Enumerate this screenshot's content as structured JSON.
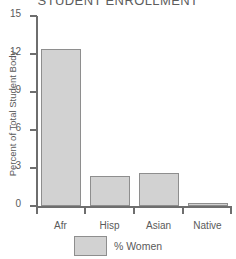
{
  "chart_data": {
    "type": "bar",
    "title": "STUDENT ENROLLMENT",
    "xlabel": "",
    "ylabel": "Percent of Total Student Body",
    "categories": [
      "Afr",
      "Hisp",
      "Asian",
      "Native"
    ],
    "series": [
      {
        "name": "% Women",
        "values": [
          12.4,
          2.4,
          2.6,
          0.2
        ]
      }
    ],
    "ylim": [
      0,
      15
    ],
    "yticks": [
      0,
      3,
      6,
      9,
      12,
      15
    ],
    "ytick_labels": [
      "0",
      "3",
      "6",
      "9",
      "12",
      "15"
    ],
    "grid": false,
    "legend": {
      "position": "bottom",
      "entries": [
        {
          "label": "% Women",
          "color": "#d2d2d2"
        }
      ]
    },
    "colors": {
      "bar_fill": "#d2d2d2",
      "bar_stroke": "#8e8e8e",
      "axis": "#6e6e6e",
      "text": "#5a5a5a"
    }
  }
}
